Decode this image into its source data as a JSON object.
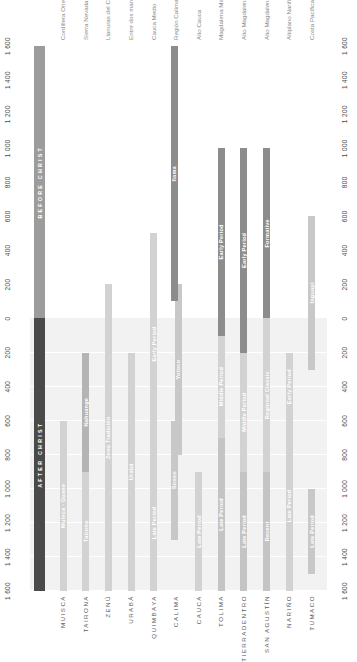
{
  "chart_data": {
    "type": "bar",
    "title": "",
    "orientation": "vertical-timeline",
    "ylabel": "",
    "xlabel": "",
    "axis": {
      "ticks": [
        1600,
        1400,
        1200,
        1000,
        800,
        600,
        400,
        200,
        0,
        200,
        400,
        600,
        800,
        1000,
        1200,
        1400,
        1600
      ],
      "tick_labels": [
        "1 600",
        "1 400",
        "1 200",
        "1 000",
        "800",
        "600",
        "400",
        "200",
        "0",
        "200",
        "400",
        "600",
        "800",
        "1 000",
        "1 200",
        "1 400",
        "1 600"
      ],
      "top_value": 1600,
      "bottom_value": -1600,
      "era_after": "AFTER CHRIST",
      "era_before": "BEFORE CHRIST",
      "grid": true,
      "legend": "none"
    },
    "colors": {
      "era_after": "#4a4a4a",
      "era_before": "#9c9c9c",
      "light": "#d2d2d2",
      "lighter": "#dcdcdc",
      "mid": "#b4b4b4",
      "dark": "#8c8c8c",
      "darker": "#7d7d7d",
      "band": "#f2f2f2",
      "background": "#ffffff"
    },
    "categories": [
      {
        "culture": "MUISCA",
        "region": "Cordillera Oriental",
        "segments": [
          {
            "label": "Muisca - Guane",
            "from": 1600,
            "to": 600,
            "color": "#d2d2d2",
            "label_color": "#ffffff"
          }
        ]
      },
      {
        "culture": "TAIRONA",
        "region": "Sierra Nevada de Santa Marta",
        "segments": [
          {
            "label": "Tairona",
            "from": 1600,
            "to": 900,
            "color": "#d2d2d2",
            "label_color": "#ffffff"
          },
          {
            "label": "Nahuange",
            "from": 900,
            "to": 200,
            "color": "#b4b4b4",
            "label_color": "#ffffff"
          }
        ]
      },
      {
        "culture": "ZENÚ",
        "region": "Llanuras del Caribe",
        "segments": [
          {
            "label": "Zenú Tradición",
            "from": 1600,
            "to": -200,
            "color": "#d2d2d2",
            "label_color": "#ffffff"
          }
        ]
      },
      {
        "culture": "URABÁ",
        "region": "Entre dos mares",
        "segments": [
          {
            "label": "Urabá",
            "from": 1600,
            "to": 200,
            "color": "#d2d2d2",
            "label_color": "#ffffff"
          }
        ]
      },
      {
        "culture": "QUIMBAYA",
        "region": "Cauca Medio",
        "segments": [
          {
            "label": "Late Period",
            "from": 1600,
            "to": 800,
            "color": "#d2d2d2",
            "label_color": "#ffffff"
          },
          {
            "label": "Early Period",
            "from": 800,
            "to": -500,
            "color": "#d2d2d2",
            "label_color": "#ffffff"
          }
        ]
      },
      {
        "culture": "CALIMA",
        "region": "Región Calima",
        "segments": [
          {
            "label": "Sonso",
            "from": 1300,
            "to": 600,
            "color": "#c8c8c8",
            "label_color": "#ffffff",
            "offset": "left"
          },
          {
            "label": "Yotoco",
            "from": 800,
            "to": -200,
            "color": "#c8c8c8",
            "label_color": "#ffffff",
            "offset": "right"
          },
          {
            "label": "Ilama",
            "from": -100,
            "to": -1600,
            "color": "#8c8c8c",
            "label_color": "#ffffff",
            "offset": "left"
          }
        ]
      },
      {
        "culture": "CAUCA",
        "region": "Alto Cauca",
        "segments": [
          {
            "label": "Late Period",
            "from": 1600,
            "to": 900,
            "color": "#d2d2d2",
            "label_color": "#ffffff"
          }
        ]
      },
      {
        "culture": "TOLIMA",
        "region": "Magdalena Medio",
        "segments": [
          {
            "label": "Late Period",
            "from": 1600,
            "to": 700,
            "color": "#c4c4c4",
            "label_color": "#ffffff"
          },
          {
            "label": "Middle Period",
            "from": 700,
            "to": 100,
            "color": "#d2d2d2",
            "label_color": "#ffffff"
          },
          {
            "label": "Early Period",
            "from": 100,
            "to": -1000,
            "color": "#8c8c8c",
            "label_color": "#ffffff"
          }
        ]
      },
      {
        "culture": "TIERRADENTRO",
        "region": "Alto Magdalena",
        "segments": [
          {
            "label": "Late Period",
            "from": 1600,
            "to": 900,
            "color": "#c4c4c4",
            "label_color": "#ffffff"
          },
          {
            "label": "Middle Period",
            "from": 900,
            "to": 200,
            "color": "#d2d2d2",
            "label_color": "#ffffff"
          },
          {
            "label": "Early Period",
            "from": 200,
            "to": -1000,
            "color": "#8c8c8c",
            "label_color": "#ffffff"
          }
        ]
      },
      {
        "culture": "SAN AGUSTÍN",
        "region": "Alto Magdalena",
        "segments": [
          {
            "label": "Recent",
            "from": 1600,
            "to": 900,
            "color": "#c4c4c4",
            "label_color": "#ffffff"
          },
          {
            "label": "Regional Classic",
            "from": 900,
            "to": 0,
            "color": "#d2d2d2",
            "label_color": "#ffffff"
          },
          {
            "label": "Formative",
            "from": 0,
            "to": -1000,
            "color": "#8c8c8c",
            "label_color": "#ffffff"
          }
        ]
      },
      {
        "culture": "NARIÑO",
        "region": "Altiplano Nariñense",
        "segments": [
          {
            "label": "Late Period",
            "from": 1600,
            "to": 600,
            "color": "#d2d2d2",
            "label_color": "#ffffff"
          },
          {
            "label": "Early Period",
            "from": 600,
            "to": 200,
            "color": "#d2d2d2",
            "label_color": "#ffffff"
          }
        ]
      },
      {
        "culture": "TUMACO",
        "region": "Costa Pacífica",
        "segments": [
          {
            "label": "Late Period",
            "from": 1500,
            "to": 1000,
            "color": "#c8c8c8",
            "label_color": "#ffffff"
          },
          {
            "label": "Inguapí",
            "from": 300,
            "to": -600,
            "color": "#c8c8c8",
            "label_color": "#ffffff"
          }
        ]
      }
    ]
  }
}
